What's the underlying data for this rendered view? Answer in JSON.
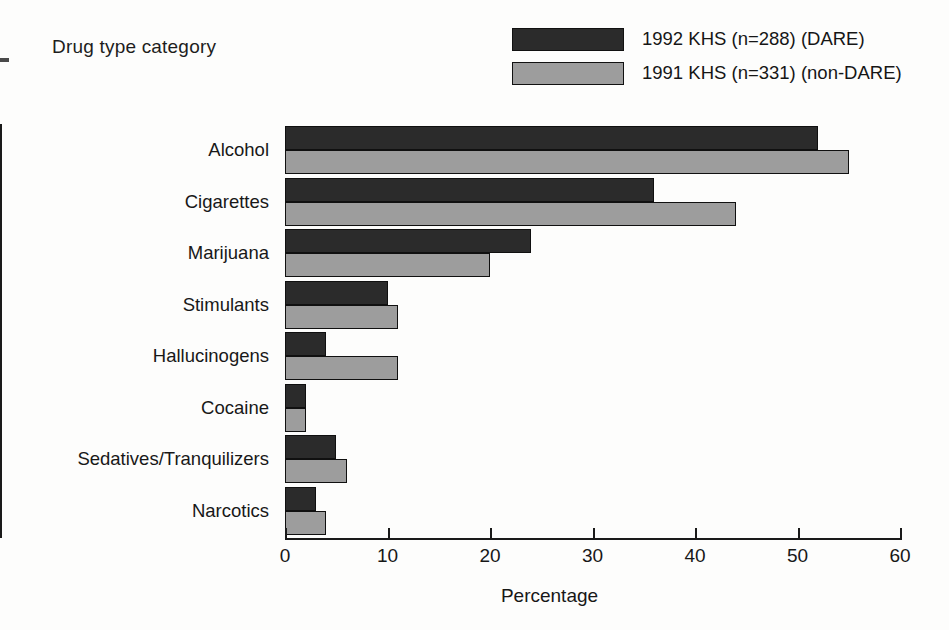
{
  "chart_data": {
    "type": "bar",
    "orientation": "horizontal",
    "title": "",
    "xlabel": "Percentage",
    "ylabel": "Drug type category",
    "xlim": [
      0,
      60
    ],
    "xticks": [
      0,
      10,
      20,
      30,
      40,
      50,
      60
    ],
    "grid": false,
    "legend_position": "top-right",
    "categories": [
      "Alcohol",
      "Cigarettes",
      "Marijuana",
      "Stimulants",
      "Hallucinogens",
      "Cocaine",
      "Sedatives/Tranquilizers",
      "Narcotics"
    ],
    "series": [
      {
        "name": "1992 KHS (n=288) (DARE)",
        "color": "#2b2b2b",
        "values": [
          52,
          36,
          24,
          10,
          4,
          2,
          5,
          3
        ]
      },
      {
        "name": "1991 KHS (n=331) (non-DARE)",
        "color": "#9d9d9d",
        "values": [
          55,
          44,
          20,
          11,
          11,
          2,
          6,
          4
        ]
      }
    ]
  },
  "axis": {
    "y_title": "Drug type category",
    "x_title": "Percentage"
  },
  "legend": {
    "items": [
      {
        "label": "1992 KHS (n=288) (DARE)",
        "color": "#2b2b2b"
      },
      {
        "label": "1991 KHS (n=331) (non-DARE)",
        "color": "#9d9d9d"
      }
    ]
  }
}
